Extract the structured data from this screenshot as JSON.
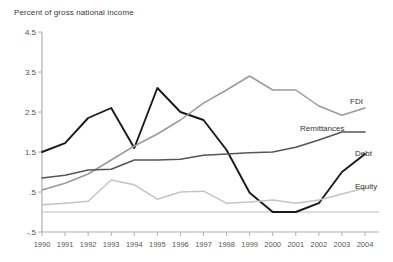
{
  "chart_data": {
    "type": "line",
    "title": "Percent of gross national income",
    "xlabel": "",
    "ylabel": "Percent of gross national income",
    "grid": false,
    "legend_position": "inline-right-end-labels",
    "x": [
      1990,
      1991,
      1992,
      1993,
      1994,
      1995,
      1996,
      1997,
      1998,
      1999,
      2000,
      2001,
      2002,
      2003,
      2004
    ],
    "categories": [
      "1990",
      "1991",
      "1992",
      "1993",
      "1994",
      "1995",
      "1996",
      "1997",
      "1998",
      "1999",
      "2000",
      "2001",
      "2002",
      "2003",
      "2004"
    ],
    "ylim": [
      -0.5,
      4.5
    ],
    "yticks": [
      -0.5,
      0.5,
      1.5,
      2.5,
      3.5,
      4.5
    ],
    "ytick_labels": [
      "-.5",
      ".5",
      "1.5",
      "2.5",
      "3.5",
      "4.5"
    ],
    "series": [
      {
        "name": "Debt",
        "color": "#1a1a1a",
        "width": 1.9,
        "label": "Debt",
        "values": [
          1.5,
          1.72,
          2.35,
          2.6,
          1.6,
          3.1,
          2.5,
          2.3,
          1.55,
          0.48,
          0.0,
          0.0,
          0.22,
          1.0,
          1.45
        ]
      },
      {
        "name": "FDI",
        "color": "#9a9a9a",
        "width": 1.5,
        "label": "FDI",
        "values": [
          0.55,
          0.72,
          0.95,
          1.3,
          1.65,
          1.95,
          2.3,
          2.72,
          3.05,
          3.4,
          3.05,
          3.05,
          2.65,
          2.42,
          2.6
        ]
      },
      {
        "name": "Remittances",
        "color": "#555555",
        "width": 1.6,
        "label": "Remittances",
        "values": [
          0.85,
          0.92,
          1.05,
          1.07,
          1.3,
          1.3,
          1.32,
          1.42,
          1.45,
          1.48,
          1.5,
          1.62,
          1.8,
          2.0,
          2.0
        ]
      },
      {
        "name": "Equity",
        "color": "#c4c4c4",
        "width": 1.5,
        "label": "Equity",
        "values": [
          0.18,
          0.22,
          0.27,
          0.8,
          0.68,
          0.32,
          0.5,
          0.52,
          0.22,
          0.25,
          0.3,
          0.22,
          0.3,
          0.45,
          0.6
        ]
      }
    ],
    "series_label_positions": [
      {
        "name": "FDI",
        "x": 350,
        "y": 104
      },
      {
        "name": "Remittances",
        "x": 300,
        "y": 131
      },
      {
        "name": "Debt",
        "x": 355,
        "y": 156
      },
      {
        "name": "Equity",
        "x": 355,
        "y": 189
      }
    ]
  }
}
